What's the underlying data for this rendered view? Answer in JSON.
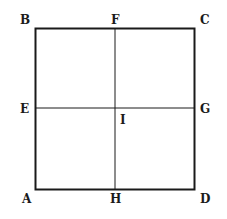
{
  "diagram": {
    "type": "square-with-midlines",
    "square": {
      "corners": {
        "bottom_left": "A",
        "top_left": "B",
        "top_right": "C",
        "bottom_right": "D"
      }
    },
    "midpoints": {
      "left": "E",
      "top": "F",
      "right": "G",
      "bottom": "H"
    },
    "center": "I",
    "labels": {
      "A": "A",
      "B": "B",
      "C": "C",
      "D": "D",
      "E": "E",
      "F": "F",
      "G": "G",
      "H": "H",
      "I": "I"
    },
    "segments": [
      "AB",
      "BC",
      "CD",
      "DA",
      "FH",
      "EG"
    ],
    "colors": {
      "stroke": "#1a1a1a",
      "background": "#ffffff"
    }
  }
}
